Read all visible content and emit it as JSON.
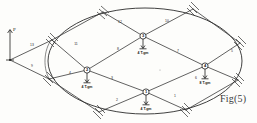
{
  "figure": {
    "caption": "Fig(5)",
    "force_label": "P",
    "boundary_shape": "ellipse"
  },
  "nodes": [
    {
      "id": "1",
      "label": "1",
      "load": "4 T.gm",
      "x": 146,
      "y": 92
    },
    {
      "id": "2",
      "label": "2",
      "load": "4 T.gm",
      "x": 87,
      "y": 70
    },
    {
      "id": "3",
      "label": "3",
      "load": "4 T.gm",
      "x": 143,
      "y": 36
    },
    {
      "id": "4",
      "label": "4",
      "load": "8 T.gm",
      "x": 205,
      "y": 66
    }
  ],
  "members": [
    {
      "label": "1",
      "x": 175,
      "y": 97
    },
    {
      "label": "2",
      "x": 117,
      "y": 101
    },
    {
      "label": "3",
      "x": 112,
      "y": 79
    },
    {
      "label": "4",
      "x": 70,
      "y": 74
    },
    {
      "label": "5",
      "x": 232,
      "y": 52
    },
    {
      "label": "6",
      "x": 196,
      "y": 79
    },
    {
      "label": "7",
      "x": 178,
      "y": 52
    },
    {
      "label": "8",
      "x": 118,
      "y": 50
    },
    {
      "label": "9",
      "x": 32,
      "y": 67
    },
    {
      "label": "10",
      "x": 167,
      "y": 22
    },
    {
      "label": "11",
      "x": 76,
      "y": 45
    },
    {
      "label": "12",
      "x": 120,
      "y": 23
    },
    {
      "label": "13",
      "x": 32,
      "y": 46
    }
  ],
  "supports": [
    {
      "name": "support-left-upper",
      "x": 52,
      "y": 40
    },
    {
      "name": "support-left-lower",
      "x": 49,
      "y": 79
    },
    {
      "name": "support-top-left",
      "x": 103,
      "y": 12
    },
    {
      "name": "support-top-right",
      "x": 193,
      "y": 8
    },
    {
      "name": "support-right-upper",
      "x": 240,
      "y": 43
    },
    {
      "name": "support-right-lower",
      "x": 238,
      "y": 80
    },
    {
      "name": "support-bottom-left",
      "x": 99,
      "y": 112
    },
    {
      "name": "support-bottom-right",
      "x": 186,
      "y": 110
    }
  ]
}
